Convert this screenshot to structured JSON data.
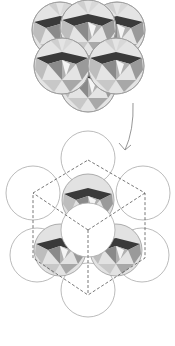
{
  "figure": {
    "colors": {
      "background": "#ffffff",
      "outline": "#9a9a9a",
      "dark_facet": "#3a3a3a",
      "mid_facet": "#808080",
      "light_facet": "#c4c4c4",
      "pale_facet": "#e2e2e2",
      "dashed_line": "#555555"
    },
    "top_cluster": {
      "sphere_radius": 28,
      "spheres": [
        {
          "cx": 60,
          "cy": 30
        },
        {
          "cx": 117,
          "cy": 30
        },
        {
          "cx": 88,
          "cy": 28
        },
        {
          "cx": 62,
          "cy": 66
        },
        {
          "cx": 116,
          "cy": 66
        },
        {
          "cx": 88,
          "cy": 84
        }
      ]
    },
    "arrow": {
      "from": [
        133,
        103
      ],
      "to": [
        125,
        150
      ]
    },
    "bottom_figure": {
      "circle_radius": 27,
      "outer_circles": [
        {
          "cx": 88,
          "cy": 158
        },
        {
          "cx": 33,
          "cy": 193
        },
        {
          "cx": 143,
          "cy": 193
        },
        {
          "cx": 37,
          "cy": 255
        },
        {
          "cx": 142,
          "cy": 255
        },
        {
          "cx": 88,
          "cy": 290
        }
      ],
      "center_circle": {
        "cx": 88,
        "cy": 230
      },
      "hexagon": [
        [
          88,
          160
        ],
        [
          145,
          193
        ],
        [
          145,
          258
        ],
        [
          88,
          295
        ],
        [
          33,
          258
        ],
        [
          33,
          193
        ]
      ],
      "cube_center": [
        88,
        230
      ]
    }
  }
}
